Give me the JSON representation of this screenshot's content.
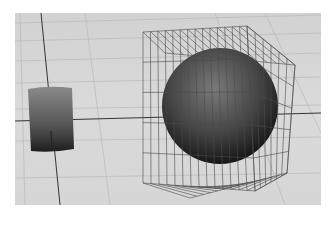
{
  "viewport": {
    "label": "3D perspective viewport",
    "background_color": "#d4d4d4",
    "grid_color": "#bdbdbd",
    "axis_color": "#333333",
    "wire_color": "#4a4a4a"
  },
  "scene": {
    "objects": [
      {
        "name": "cylinder",
        "type": "cylinder",
        "shading": "smooth-shaded"
      },
      {
        "name": "sphere",
        "type": "sphere",
        "shading": "smooth-shaded"
      },
      {
        "name": "lattice-cage",
        "type": "wireframe-box",
        "shading": "wireframe"
      }
    ]
  }
}
